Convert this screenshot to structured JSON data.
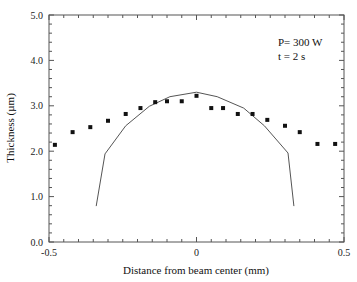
{
  "chart_data": {
    "type": "scatter",
    "title": "",
    "xlabel": "Distance from beam center (mm)",
    "ylabel": "Thickness (µm)",
    "xlim": [
      -0.5,
      0.5
    ],
    "ylim": [
      0.0,
      5.0
    ],
    "x_ticks": [
      -0.5,
      0,
      0.5
    ],
    "x_tick_labels": [
      "-0.5",
      "0",
      "0.5"
    ],
    "y_ticks": [
      0.0,
      1.0,
      2.0,
      3.0,
      4.0,
      5.0
    ],
    "y_tick_labels": [
      "0.0",
      "1.0",
      "2.0",
      "3.0",
      "4.0",
      "5.0"
    ],
    "grid": false,
    "annotations": [
      "P= 300 W",
      "t = 2 s"
    ],
    "annotation_position": "top-right",
    "series": [
      {
        "name": "measured",
        "style": "square-markers",
        "x": [
          -0.48,
          -0.42,
          -0.36,
          -0.3,
          -0.24,
          -0.19,
          -0.14,
          -0.1,
          -0.05,
          0.0,
          0.05,
          0.09,
          0.14,
          0.19,
          0.24,
          0.3,
          0.35,
          0.41,
          0.47
        ],
        "y": [
          2.14,
          2.42,
          2.53,
          2.67,
          2.82,
          2.95,
          3.08,
          3.1,
          3.1,
          3.22,
          2.95,
          2.95,
          2.82,
          2.82,
          2.69,
          2.56,
          2.42,
          2.16,
          2.16
        ]
      },
      {
        "name": "calculated",
        "style": "line",
        "x": [
          -0.34,
          -0.31,
          -0.24,
          -0.16,
          -0.09,
          0.0,
          0.07,
          0.16,
          0.23,
          0.31,
          0.33
        ],
        "y": [
          0.79,
          1.94,
          2.56,
          2.99,
          3.2,
          3.3,
          3.2,
          2.95,
          2.56,
          1.96,
          0.79
        ]
      }
    ]
  }
}
